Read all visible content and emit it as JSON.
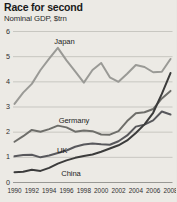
{
  "figure": {
    "title": "Race for second",
    "subtitle": "Nominal GDP, $trn"
  },
  "chart_data": {
    "type": "line",
    "title": "Race for second",
    "subtitle": "Nominal GDP, $trn",
    "xlabel": "",
    "ylabel": "Nominal GDP, $trn",
    "xlim": [
      1990,
      2008
    ],
    "ylim": [
      0,
      6
    ],
    "yticks": [
      0,
      1,
      2,
      3,
      4,
      5,
      6
    ],
    "xticks": [
      1990,
      1992,
      1994,
      1996,
      1998,
      2000,
      2002,
      2004,
      2006,
      2008
    ],
    "ytick_labels": [
      "0",
      "1",
      "2",
      "3",
      "4",
      "5",
      "6"
    ],
    "xtick_labels": [
      "1990",
      "1992",
      "1994",
      "1996",
      "1998",
      "2000",
      "2002",
      "2004",
      "2006",
      "2008"
    ],
    "grid": true,
    "grid_axis": "y",
    "legend": "inline-labels",
    "x": [
      1990,
      1991,
      1992,
      1993,
      1994,
      1995,
      1996,
      1997,
      1998,
      1999,
      2000,
      2001,
      2002,
      2003,
      2004,
      2005,
      2006,
      2007,
      2008
    ],
    "series": [
      {
        "name": "Japan",
        "color": "#9a9a96",
        "label_x": 1994.6,
        "label_y": 5.55,
        "values": [
          3.1,
          3.55,
          3.9,
          4.45,
          4.9,
          5.33,
          4.83,
          4.4,
          3.95,
          4.45,
          4.73,
          4.16,
          3.98,
          4.3,
          4.65,
          4.57,
          4.36,
          4.38,
          4.89
        ]
      },
      {
        "name": "Germany",
        "color": "#6e6e6a",
        "label_x": 1995.1,
        "label_y": 2.42,
        "values": [
          1.6,
          1.82,
          2.07,
          2.0,
          2.1,
          2.24,
          2.17,
          2.0,
          2.05,
          2.02,
          1.89,
          1.88,
          2.02,
          2.42,
          2.73,
          2.77,
          2.9,
          3.32,
          3.62
        ]
      },
      {
        "name": "UK",
        "color": "#58585c",
        "label_x": 1994.9,
        "label_y": 1.25,
        "values": [
          1.02,
          1.07,
          1.08,
          0.98,
          1.05,
          1.15,
          1.25,
          1.4,
          1.49,
          1.53,
          1.5,
          1.48,
          1.62,
          1.85,
          2.2,
          2.28,
          2.45,
          2.8,
          2.68
        ]
      },
      {
        "name": "China",
        "color": "#3b3b3b",
        "label_x": 1995.4,
        "label_y": 0.33,
        "values": [
          0.39,
          0.41,
          0.49,
          0.44,
          0.56,
          0.73,
          0.86,
          0.96,
          1.03,
          1.09,
          1.2,
          1.33,
          1.46,
          1.65,
          1.95,
          2.29,
          2.75,
          3.5,
          4.33
        ]
      }
    ]
  }
}
